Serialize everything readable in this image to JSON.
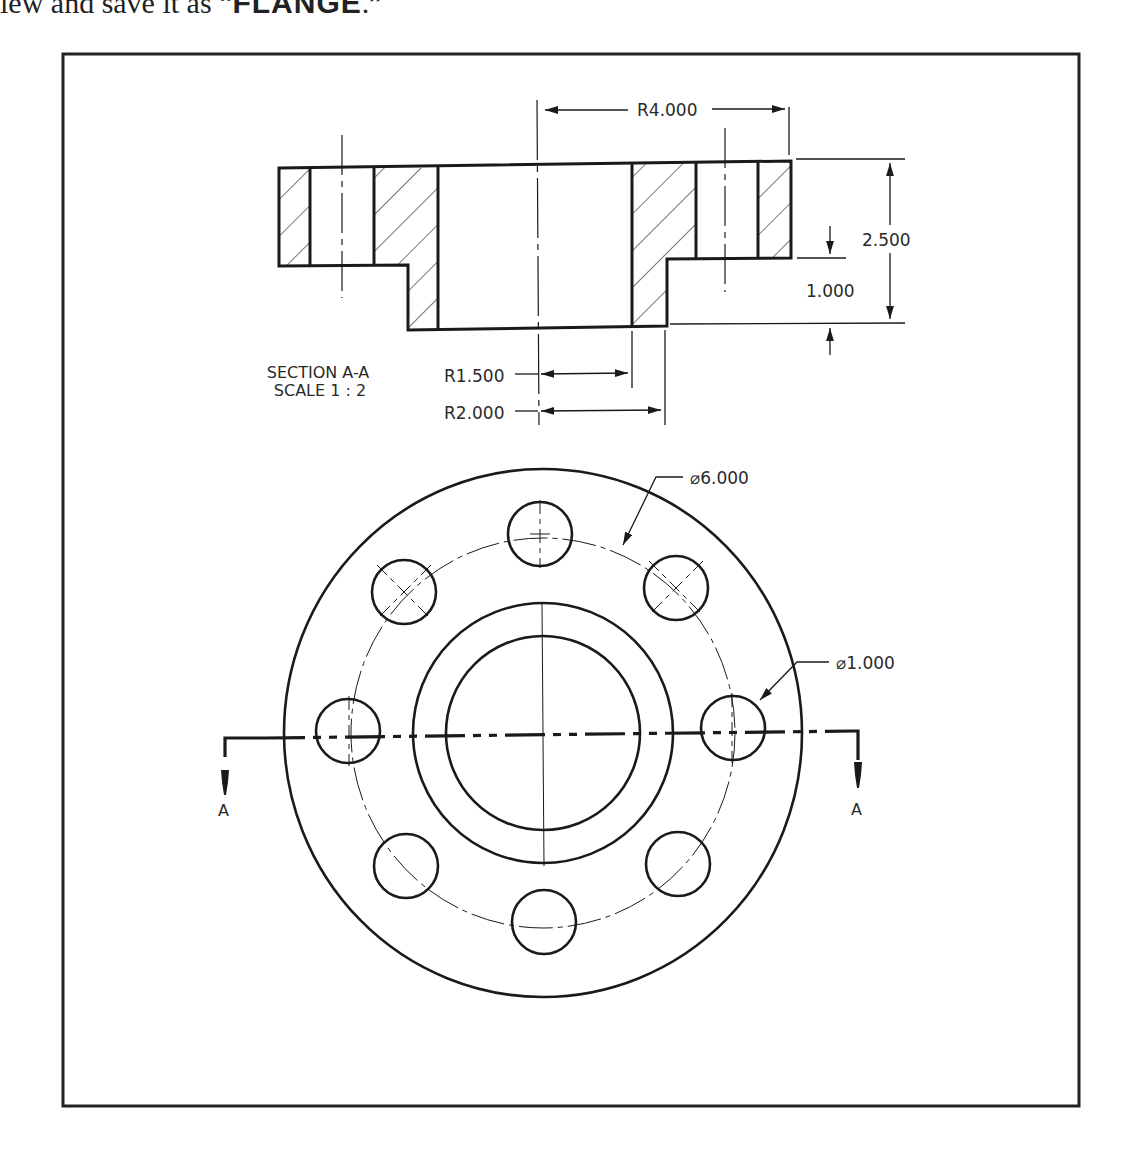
{
  "caption": {
    "prefix": "iew and save it as “",
    "filename": "FLANGE",
    "suffix": ".”"
  },
  "drawing": {
    "section_view": {
      "title_line1": "SECTION A-A",
      "title_line2": "SCALE 1 : 2",
      "dimensions": {
        "outer_radius": "R4.000",
        "total_height": "2.500",
        "flange_thickness": "1.000",
        "bore_radius": "R1.500",
        "hub_radius": "R2.000"
      }
    },
    "front_view": {
      "bolt_circle_diameter": "⌀6.000",
      "bolt_hole_diameter": "⌀1.000",
      "bolt_hole_count": 8,
      "section_marker_left": "A",
      "section_marker_right": "A"
    }
  },
  "colors": {
    "line": "#1a1a1a",
    "frame": "#222222",
    "background": "#ffffff"
  }
}
